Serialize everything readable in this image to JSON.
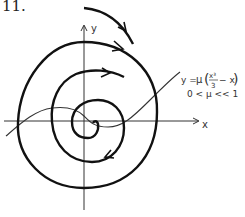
{
  "figure": {
    "number_label": "11.",
    "x_axis_label": "x",
    "y_axis_label": "y",
    "nullcline_equation": "y = μ(x³/3 − x)",
    "nullcline_eq_lhs": "y =",
    "nullcline_eq_mu": "μ",
    "nullcline_eq_num": "x³",
    "nullcline_eq_den": "3",
    "nullcline_eq_tail": "− x",
    "condition": "0 < μ << 1"
  }
}
